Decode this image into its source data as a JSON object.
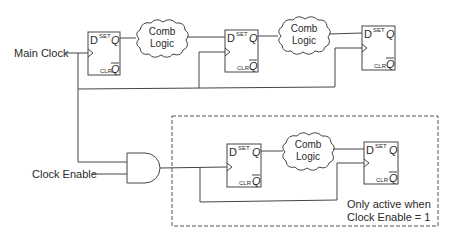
{
  "diagram": {
    "title": "",
    "inputs": {
      "main_clock": "Main Clock",
      "clock_enable": "Clock Enable"
    },
    "flip_flop_pins": {
      "d": "D",
      "set": "SET",
      "q": "Q",
      "clr": "CLR",
      "qbar": "Q"
    },
    "comb_logic": {
      "line1": "Comb",
      "line2": "Logic"
    },
    "gated_region": {
      "note_line1": "Only active when",
      "note_line2": "Clock Enable = 1"
    },
    "components": [
      {
        "id": "ff1",
        "type": "d-flip-flop",
        "clock": "main"
      },
      {
        "id": "cl1",
        "type": "combinational-logic"
      },
      {
        "id": "ff2",
        "type": "d-flip-flop",
        "clock": "main"
      },
      {
        "id": "cl2",
        "type": "combinational-logic"
      },
      {
        "id": "ff3",
        "type": "d-flip-flop",
        "clock": "main"
      },
      {
        "id": "and1",
        "type": "and-gate",
        "inputs": [
          "Main Clock",
          "Clock Enable"
        ]
      },
      {
        "id": "ff4",
        "type": "d-flip-flop",
        "clock": "gated"
      },
      {
        "id": "cl3",
        "type": "combinational-logic"
      },
      {
        "id": "ff5",
        "type": "d-flip-flop",
        "clock": "gated"
      }
    ],
    "colors": {
      "line": "#444444",
      "text": "#2a2a2a",
      "background": "#ffffff"
    }
  }
}
